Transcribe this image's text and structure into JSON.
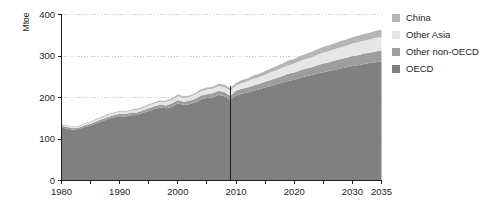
{
  "chart_data": {
    "type": "area",
    "stacked": true,
    "title": "",
    "subtitle": "",
    "xlabel": "",
    "ylabel": "Mtoe",
    "xlim": [
      1980,
      2035
    ],
    "ylim": [
      0,
      400
    ],
    "grid": true,
    "gridlines_y": [
      100,
      200,
      300,
      400
    ],
    "legend_position": "right",
    "x": [
      1980,
      1981,
      1982,
      1983,
      1984,
      1985,
      1986,
      1987,
      1988,
      1989,
      1990,
      1991,
      1992,
      1993,
      1994,
      1995,
      1996,
      1997,
      1998,
      1999,
      2000,
      2001,
      2002,
      2003,
      2004,
      2005,
      2006,
      2007,
      2008,
      2009,
      2010,
      2011,
      2012,
      2013,
      2014,
      2015,
      2016,
      2017,
      2018,
      2019,
      2020,
      2021,
      2022,
      2023,
      2024,
      2025,
      2026,
      2027,
      2028,
      2029,
      2030,
      2031,
      2032,
      2033,
      2034,
      2035
    ],
    "xticks": [
      1980,
      1990,
      2000,
      2010,
      2020,
      2030,
      2035
    ],
    "xtick_labels": [
      "1980",
      "1990",
      "2000",
      "2010",
      "2020",
      "2030",
      "2035"
    ],
    "yticks": [
      0,
      100,
      200,
      300,
      400
    ],
    "ytick_labels": [
      "0",
      "100",
      "200",
      "300",
      "400"
    ],
    "minor_xtick_step": 5,
    "annotations": [
      {
        "type": "vline",
        "x": 2009,
        "label": "",
        "color": "#231f20"
      }
    ],
    "series": [
      {
        "name": "OECD",
        "color": "#808080",
        "values": [
          128,
          125,
          122,
          124,
          129,
          132,
          138,
          143,
          148,
          152,
          155,
          154,
          157,
          158,
          163,
          167,
          172,
          176,
          174,
          178,
          186,
          182,
          184,
          188,
          196,
          199,
          200,
          206,
          203,
          194,
          205,
          209,
          212,
          216,
          220,
          224,
          228,
          232,
          236,
          240,
          243,
          247,
          251,
          254,
          258,
          261,
          264,
          267,
          270,
          273,
          276,
          278,
          281,
          283,
          285,
          287
        ]
      },
      {
        "name": "Other non-OECD",
        "color": "#9d9d9d",
        "values": [
          4,
          4,
          4,
          4,
          4,
          5,
          5,
          5,
          5,
          5,
          6,
          6,
          6,
          6,
          6,
          7,
          7,
          7,
          7,
          8,
          8,
          8,
          8,
          9,
          9,
          9,
          10,
          10,
          10,
          10,
          11,
          12,
          12,
          13,
          13,
          14,
          15,
          15,
          16,
          17,
          17,
          18,
          19,
          19,
          20,
          21,
          21,
          22,
          23,
          23,
          24,
          24,
          25,
          25,
          26,
          26
        ]
      },
      {
        "name": "Other Asia",
        "color": "#e6e6e6",
        "values": [
          3,
          3,
          3,
          3,
          4,
          4,
          4,
          4,
          5,
          5,
          5,
          5,
          6,
          6,
          6,
          7,
          7,
          7,
          8,
          8,
          9,
          9,
          9,
          10,
          10,
          11,
          11,
          12,
          12,
          12,
          13,
          14,
          15,
          16,
          16,
          17,
          18,
          19,
          20,
          21,
          22,
          23,
          23,
          24,
          25,
          26,
          27,
          28,
          28,
          29,
          30,
          31,
          31,
          32,
          33,
          33
        ]
      },
      {
        "name": "China",
        "color": "#b5b5b5",
        "values": [
          1,
          1,
          1,
          1,
          1,
          1,
          2,
          2,
          2,
          2,
          2,
          2,
          2,
          3,
          3,
          3,
          3,
          3,
          3,
          4,
          4,
          4,
          4,
          4,
          5,
          5,
          5,
          5,
          6,
          6,
          6,
          7,
          7,
          8,
          8,
          9,
          9,
          10,
          10,
          11,
          11,
          12,
          12,
          13,
          13,
          14,
          14,
          14,
          15,
          15,
          15,
          16,
          16,
          16,
          17,
          17
        ]
      }
    ]
  },
  "legend": {
    "items": [
      {
        "label": "China",
        "color": "#b5b5b5"
      },
      {
        "label": "Other Asia",
        "color": "#e6e6e6"
      },
      {
        "label": "Other non-OECD",
        "color": "#9d9d9d"
      },
      {
        "label": "OECD",
        "color": "#808080"
      }
    ]
  },
  "axes": {
    "y_title": "Mtoe"
  },
  "colors": {
    "axis": "#231f20",
    "grid": "#c8c8c8",
    "background": "#ffffff",
    "divider": "#231f20"
  }
}
